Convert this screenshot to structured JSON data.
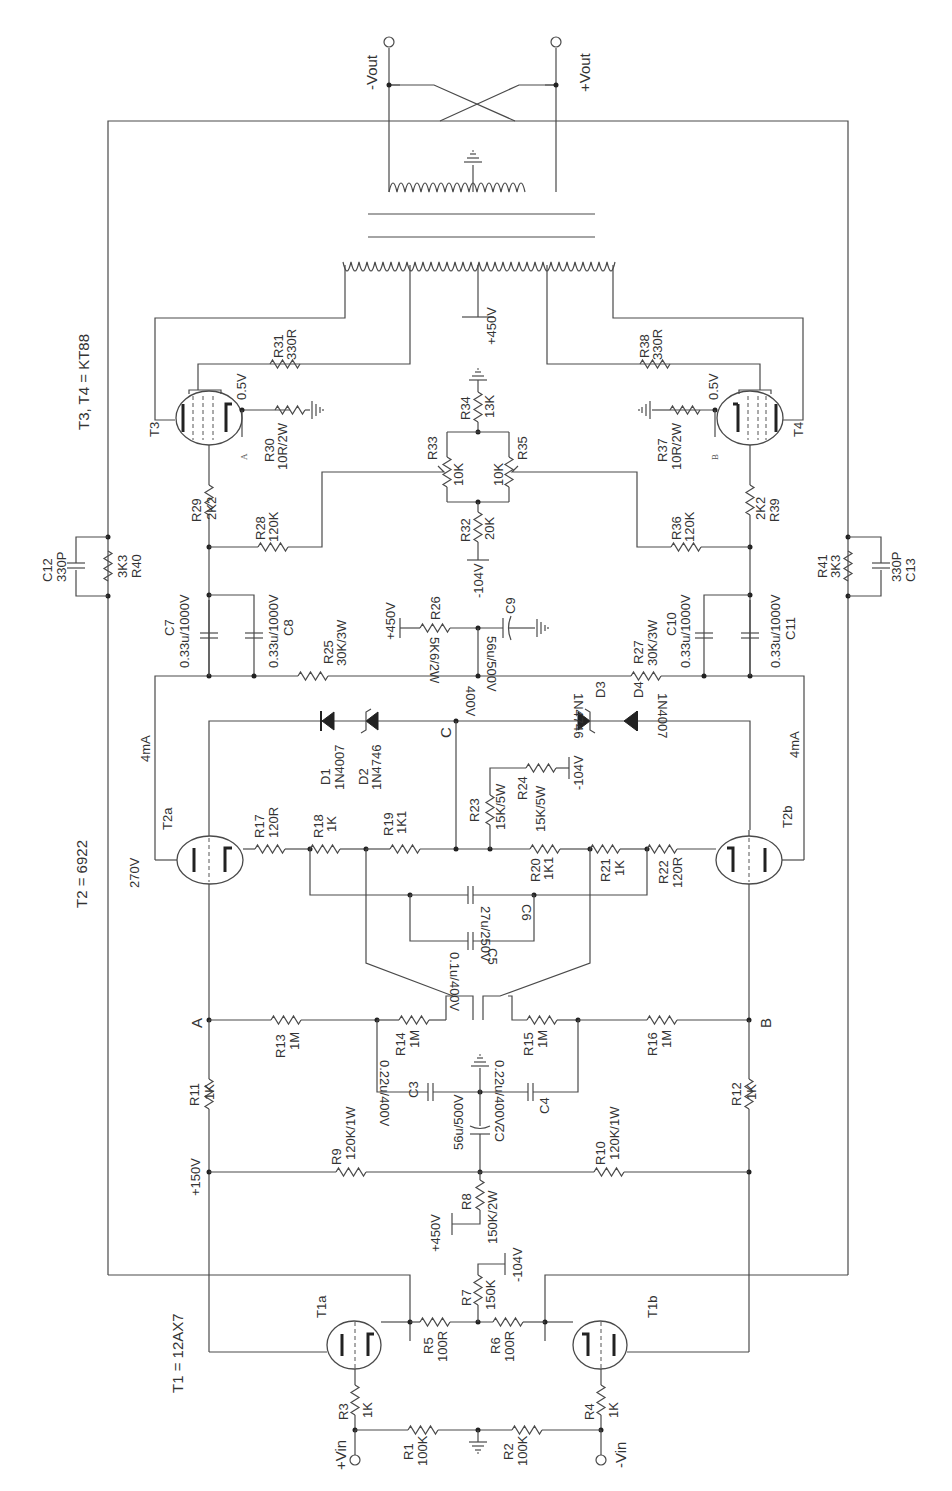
{
  "schematic": {
    "title_notes": {
      "t1": "T1 = 12AX7",
      "t2": "T2 = 6922",
      "t34": "T3, T4 = KT88"
    },
    "terminals": {
      "vin_pos": "+Vin",
      "vin_neg": "-Vin",
      "vout_neg": "-Vout",
      "vout_pos": "+Vout"
    },
    "tubes": {
      "t1a": "T1a",
      "t1b": "T1b",
      "t2a": "T2a",
      "t2b": "T2b",
      "t3": "T3",
      "t4": "T4"
    },
    "nodes": {
      "a": "A",
      "b": "B",
      "c": "C",
      "a_small": "A",
      "b_small": "B"
    },
    "voltages": {
      "plus150": "+150V",
      "plus450_r8": "+450V",
      "minus104_r7": "-104V",
      "v270": "270V",
      "i4ma_left": "4mA",
      "i4ma_right": "4mA",
      "v400": "400V",
      "minus104_r24": "-104V",
      "plus450_r26": "+450V",
      "minus104_r32": "-104V",
      "plus450_ot": "+450V",
      "v05_left": "0.5V",
      "v05_right": "0.5V"
    },
    "resistors": {
      "r1": {
        "ref": "R1",
        "val": "100K"
      },
      "r2": {
        "ref": "R2",
        "val": "100K"
      },
      "r3": {
        "ref": "R3",
        "val": "1K"
      },
      "r4": {
        "ref": "R4",
        "val": "1K"
      },
      "r5": {
        "ref": "R5",
        "val": "100R"
      },
      "r6": {
        "ref": "R6",
        "val": "100R"
      },
      "r7": {
        "ref": "R7",
        "val": "150K"
      },
      "r8": {
        "ref": "R8",
        "val": "150K/2W"
      },
      "r9": {
        "ref": "R9",
        "val": "120K/1W"
      },
      "r10": {
        "ref": "R10",
        "val": "120K/1W"
      },
      "r11": {
        "ref": "R11",
        "val": "1K"
      },
      "r12": {
        "ref": "R12",
        "val": "1K"
      },
      "r13": {
        "ref": "R13",
        "val": "1M"
      },
      "r14": {
        "ref": "R14",
        "val": "1M"
      },
      "r15": {
        "ref": "R15",
        "val": "1M"
      },
      "r16": {
        "ref": "R16",
        "val": "1M"
      },
      "r17": {
        "ref": "R17",
        "val": "120R"
      },
      "r18": {
        "ref": "R18",
        "val": "1K"
      },
      "r19": {
        "ref": "R19",
        "val": "1K1"
      },
      "r20": {
        "ref": "R20",
        "val": "1K1"
      },
      "r21": {
        "ref": "R21",
        "val": "1K"
      },
      "r22": {
        "ref": "R22",
        "val": "120R"
      },
      "r23": {
        "ref": "R23",
        "val": "15K/5W"
      },
      "r24": {
        "ref": "R24",
        "val": "15K/5W"
      },
      "r25": {
        "ref": "R25",
        "val": "30K/3W"
      },
      "r26": {
        "ref": "R26",
        "val": "5K6/2W"
      },
      "r27": {
        "ref": "R27",
        "val": "30K/3W"
      },
      "r28": {
        "ref": "R28",
        "val": "120K"
      },
      "r29": {
        "ref": "R29",
        "val": "2K2"
      },
      "r30": {
        "ref": "R30",
        "val": "10R/2W"
      },
      "r31": {
        "ref": "R31",
        "val": "330R"
      },
      "r32": {
        "ref": "R32",
        "val": "20K"
      },
      "r33": {
        "ref": "R33",
        "val": "10K"
      },
      "r34": {
        "ref": "R34",
        "val": "13K"
      },
      "r35": {
        "ref": "R35",
        "val": "10K"
      },
      "r36": {
        "ref": "R36",
        "val": "120K"
      },
      "r37": {
        "ref": "R37",
        "val": "10R/2W"
      },
      "r38": {
        "ref": "R38",
        "val": "330R"
      },
      "r39": {
        "ref": "R39",
        "val": "2K2"
      },
      "r40": {
        "ref": "R40",
        "val": "3K3"
      },
      "r41": {
        "ref": "R41",
        "val": "3K3"
      }
    },
    "capacitors": {
      "c2": {
        "ref": "C2",
        "val": "56u/500V"
      },
      "c3": {
        "ref": "C3",
        "val": "0.22u/400V"
      },
      "c4": {
        "ref": "C4",
        "val": "0.22u/400V"
      },
      "c5": {
        "ref": "C5",
        "val": "0.1u/400V"
      },
      "c6": {
        "ref": "C6",
        "val": "27u/250V"
      },
      "c7": {
        "ref": "C7",
        "val": "0.33u/1000V"
      },
      "c8": {
        "ref": "C8",
        "val": "0.33u/1000V"
      },
      "c9": {
        "ref": "C9",
        "val": "56u/500V"
      },
      "c10": {
        "ref": "C10",
        "val": "0.33u/1000V"
      },
      "c11": {
        "ref": "C11",
        "val": "0.33u/1000V"
      },
      "c12": {
        "ref": "C12",
        "val": "330P"
      },
      "c13": {
        "ref": "C13",
        "val": "330P"
      }
    },
    "diodes": {
      "d1": {
        "ref": "D1",
        "val": "1N4007"
      },
      "d2": {
        "ref": "D2",
        "val": "1N4746"
      },
      "d3": {
        "ref": "D3",
        "val": "1N4746"
      },
      "d4": {
        "ref": "D4",
        "val": "1N4007"
      }
    }
  }
}
